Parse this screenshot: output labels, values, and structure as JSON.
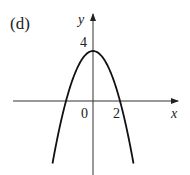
{
  "panel_label": "(d)",
  "chart_data": {
    "type": "line",
    "title": "(d)",
    "xlabel": "x",
    "ylabel": "y",
    "function": "y = 4 - x^2",
    "x_ticks": [
      {
        "value": 0,
        "label": "0"
      },
      {
        "value": 2,
        "label": "2"
      }
    ],
    "y_ticks": [
      {
        "value": 4,
        "label": "4"
      }
    ],
    "vertex": {
      "x": 0,
      "y": 4
    },
    "roots": [
      -2,
      2
    ],
    "xlim": [
      -3,
      3.4
    ],
    "ylim": [
      -3,
      4.8
    ],
    "grid": false,
    "legend": null,
    "series": [
      {
        "name": "parabola",
        "x": [
          -2.6,
          -2,
          -1,
          0,
          1,
          2,
          2.6
        ],
        "y": [
          -2.76,
          0,
          3,
          4,
          3,
          0,
          -2.76
        ]
      }
    ]
  },
  "labels": {
    "origin": "0",
    "x_tick_2": "2",
    "y_tick_4": "4",
    "x_axis": "x",
    "y_axis": "y"
  }
}
